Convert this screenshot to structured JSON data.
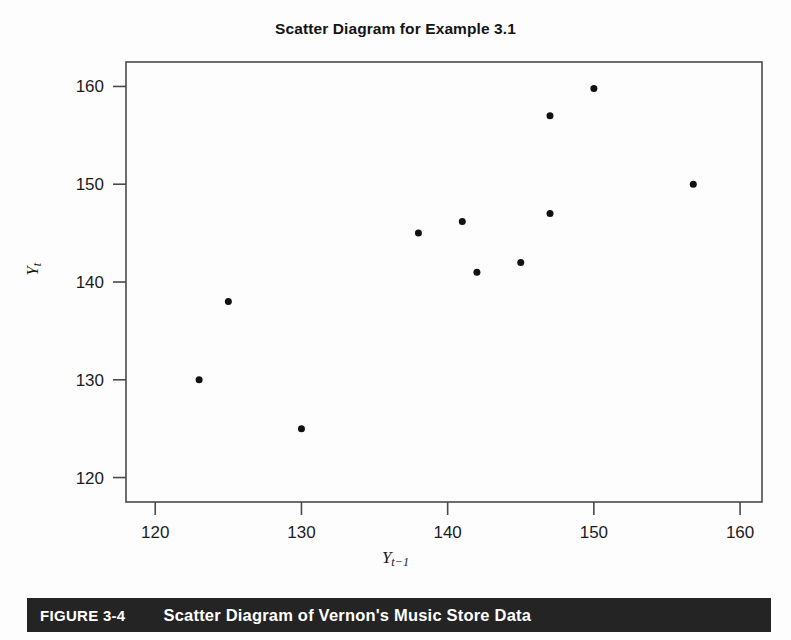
{
  "figure": {
    "caption_number": "FIGURE 3-4",
    "caption_title": "Scatter Diagram of Vernon's Music Store Data",
    "caption_bar_color": "#242424",
    "caption_text_color": "#ffffff"
  },
  "chart_data": {
    "type": "scatter",
    "title": "Scatter Diagram for Example 3.1",
    "xlabel": "Y t-1",
    "ylabel": "Y t",
    "xlabel_base": "Y",
    "xlabel_sub": "t−1",
    "ylabel_base": "Y",
    "ylabel_sub": "t",
    "xlim": [
      118,
      161.5
    ],
    "ylim": [
      117.5,
      162.5
    ],
    "xticks": [
      120,
      130,
      140,
      150,
      160
    ],
    "yticks": [
      120,
      130,
      140,
      150,
      160
    ],
    "xtick_labels": [
      "120",
      "130",
      "140",
      "150",
      "160"
    ],
    "ytick_labels": [
      "120",
      "130",
      "140",
      "150",
      "160"
    ],
    "grid": false,
    "legend": false,
    "marker": "filled-circle",
    "marker_color": "#111111",
    "marker_size_px": 7,
    "axes_color": "#4a4a4a",
    "background": "#fdfdfd",
    "n_points": 11,
    "x": [
      123,
      125,
      130,
      138,
      141,
      142,
      145,
      147,
      147,
      150,
      156.8
    ],
    "y": [
      130,
      138,
      125,
      145,
      146.2,
      141,
      142,
      147,
      157,
      159.8,
      150
    ],
    "points": [
      {
        "x": 123,
        "y": 130
      },
      {
        "x": 125,
        "y": 138
      },
      {
        "x": 130,
        "y": 125
      },
      {
        "x": 138,
        "y": 145
      },
      {
        "x": 141,
        "y": 146.2
      },
      {
        "x": 142,
        "y": 141
      },
      {
        "x": 145,
        "y": 142
      },
      {
        "x": 147,
        "y": 147
      },
      {
        "x": 147,
        "y": 157
      },
      {
        "x": 150,
        "y": 159.8
      },
      {
        "x": 156.8,
        "y": 150
      }
    ]
  }
}
